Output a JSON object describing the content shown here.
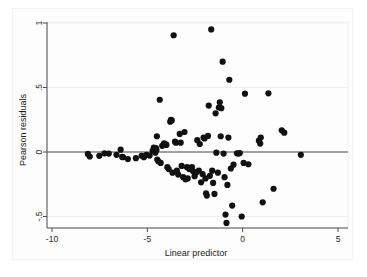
{
  "chart_data": {
    "type": "scatter",
    "title": "",
    "xlabel": "Linear predictor",
    "ylabel": "Pearson residuals",
    "xlim": [
      -10.6,
      5.4
    ],
    "ylim": [
      -0.62,
      1.05
    ],
    "xticks": [
      -10,
      -5,
      0,
      5
    ],
    "xticklabels": [
      "-10",
      "-5",
      "0",
      "5"
    ],
    "yticks": [
      1,
      0.5,
      0,
      -0.5
    ],
    "yticklabels": [
      "1",
      ".5",
      "0",
      "-.5"
    ],
    "grid": "horizontal-faint",
    "legend": "none",
    "reference_line": {
      "orientation": "horizontal",
      "y": 0
    },
    "marker": {
      "shape": "circle",
      "color": "#111111",
      "size": 3.1
    },
    "n_points": 103,
    "points": [
      [
        -8.12,
        -0.015
      ],
      [
        -8.02,
        -0.035
      ],
      [
        -7.52,
        -0.03
      ],
      [
        -7.25,
        -0.01
      ],
      [
        -7.02,
        -0.012
      ],
      [
        -6.62,
        -0.022
      ],
      [
        -6.4,
        0.018
      ],
      [
        -6.32,
        -0.038
      ],
      [
        -6.28,
        -0.04
      ],
      [
        -6.02,
        -0.055
      ],
      [
        -5.6,
        -0.048
      ],
      [
        -5.3,
        -0.03
      ],
      [
        -5.18,
        -0.04
      ],
      [
        -5.05,
        -0.022
      ],
      [
        -4.88,
        -0.028
      ],
      [
        -4.72,
        0.01
      ],
      [
        -4.66,
        0.035
      ],
      [
        -4.62,
        0.005
      ],
      [
        -4.58,
        -0.005
      ],
      [
        -4.55,
        0.03
      ],
      [
        -4.52,
        0.015
      ],
      [
        -4.5,
        0.122
      ],
      [
        -4.48,
        -0.058
      ],
      [
        -4.42,
        -0.072
      ],
      [
        -4.35,
        0.405
      ],
      [
        -4.3,
        -0.085
      ],
      [
        -4.22,
        0.048
      ],
      [
        -4.12,
        0.068
      ],
      [
        -4.05,
        0.062
      ],
      [
        -4.0,
        0.055
      ],
      [
        -3.95,
        -0.118
      ],
      [
        -3.88,
        -0.132
      ],
      [
        -3.8,
        0.235
      ],
      [
        -3.76,
        0.25
      ],
      [
        -3.72,
        0.245
      ],
      [
        -3.68,
        -0.16
      ],
      [
        -3.62,
        0.905
      ],
      [
        -3.55,
        0.08
      ],
      [
        -3.5,
        0.072
      ],
      [
        -3.45,
        -0.145
      ],
      [
        -3.38,
        -0.175
      ],
      [
        -3.3,
        0.14
      ],
      [
        -3.25,
        0.072
      ],
      [
        -3.2,
        -0.108
      ],
      [
        -3.12,
        -0.195
      ],
      [
        -3.05,
        0.155
      ],
      [
        -3.0,
        -0.212
      ],
      [
        -2.92,
        -0.118
      ],
      [
        -2.88,
        -0.205
      ],
      [
        -2.8,
        -0.132
      ],
      [
        -2.72,
        -0.125
      ],
      [
        -2.66,
        -0.118
      ],
      [
        -2.6,
        -0.15
      ],
      [
        -2.52,
        -0.188
      ],
      [
        -2.45,
        -0.16
      ],
      [
        -2.38,
        0.092
      ],
      [
        -2.3,
        -0.145
      ],
      [
        -2.25,
        0.062
      ],
      [
        -2.18,
        -0.235
      ],
      [
        -2.1,
        -0.172
      ],
      [
        -2.05,
        0.112
      ],
      [
        -2.0,
        0.105
      ],
      [
        -1.95,
        -0.205
      ],
      [
        -1.92,
        -0.32
      ],
      [
        -1.88,
        -0.338
      ],
      [
        -1.82,
        0.125
      ],
      [
        -1.78,
        0.36
      ],
      [
        -1.72,
        -0.185
      ],
      [
        -1.65,
        0.95
      ],
      [
        -1.6,
        -0.145
      ],
      [
        -1.55,
        -0.24
      ],
      [
        -1.48,
        -0.325
      ],
      [
        -1.42,
        0.3
      ],
      [
        -1.38,
        -0.005
      ],
      [
        -1.3,
        -0.16
      ],
      [
        -1.25,
        0.345
      ],
      [
        -1.2,
        0.385
      ],
      [
        -1.15,
        0.122
      ],
      [
        -1.12,
        0.34
      ],
      [
        -1.05,
        0.7
      ],
      [
        -1.0,
        -0.012
      ],
      [
        -0.95,
        -0.195
      ],
      [
        -0.9,
        -0.485
      ],
      [
        -0.85,
        -0.55
      ],
      [
        -0.8,
        -0.255
      ],
      [
        -0.75,
        0.112
      ],
      [
        -0.7,
        0.56
      ],
      [
        -0.62,
        -0.128
      ],
      [
        -0.55,
        -0.415
      ],
      [
        -0.48,
        -0.098
      ],
      [
        -0.3,
        -0.01
      ],
      [
        -0.22,
        -0.012
      ],
      [
        -0.15,
        -0.008
      ],
      [
        -0.05,
        -0.5
      ],
      [
        0.05,
        -0.085
      ],
      [
        0.12,
        0.452
      ],
      [
        0.3,
        -0.095
      ],
      [
        0.85,
        0.088
      ],
      [
        0.92,
        0.065
      ],
      [
        0.95,
        0.112
      ],
      [
        1.05,
        -0.39
      ],
      [
        1.35,
        0.455
      ],
      [
        1.62,
        -0.285
      ],
      [
        2.05,
        0.168
      ],
      [
        2.18,
        0.15
      ],
      [
        3.05,
        -0.022
      ]
    ]
  }
}
